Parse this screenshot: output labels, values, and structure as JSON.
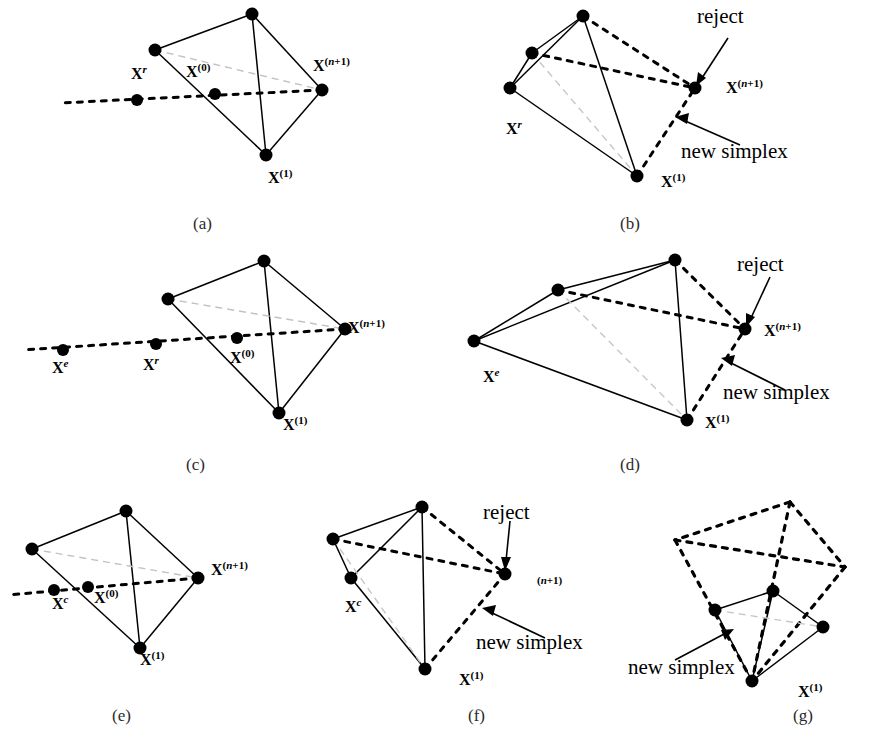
{
  "figure": {
    "background": "#ffffff",
    "ink": "#000000",
    "faint": "#b9b9b9",
    "width": 875,
    "height": 747
  },
  "captions": [
    {
      "id": "a",
      "text": "(a)",
      "x": 193,
      "y": 214
    },
    {
      "id": "b",
      "text": "(b)",
      "x": 620,
      "y": 214
    },
    {
      "id": "c",
      "text": "(c)",
      "x": 186,
      "y": 455
    },
    {
      "id": "d",
      "text": "(d)",
      "x": 620,
      "y": 455
    },
    {
      "id": "e",
      "text": "(e)",
      "x": 112,
      "y": 706
    },
    {
      "id": "f",
      "text": "(f)",
      "x": 468,
      "y": 706
    },
    {
      "id": "g",
      "text": "(g)",
      "x": 793,
      "y": 706
    }
  ],
  "panels": {
    "a": {
      "caption": "(a)",
      "operation": "reflection",
      "labels": [
        {
          "name": "x-r",
          "base": "X",
          "sup": "r",
          "sup_style": "italic",
          "x": 131,
          "y": 64
        },
        {
          "name": "x-0",
          "base": "X",
          "sup": "(0)",
          "sup_style": "roman",
          "x": 186,
          "y": 62
        },
        {
          "name": "x-n-plus-1",
          "base": "X",
          "sup": "(n+1)",
          "sup_style": "mixed",
          "x": 313,
          "y": 56
        },
        {
          "name": "x-1",
          "base": "X",
          "sup": "(1)",
          "sup_style": "roman",
          "x": 268,
          "y": 168
        }
      ],
      "annotations": []
    },
    "b": {
      "caption": "(b)",
      "operation": "reflection accepted - new simplex",
      "labels": [
        {
          "name": "x-r",
          "base": "X",
          "sup": "r",
          "sup_style": "italic",
          "x": 506,
          "y": 119
        },
        {
          "name": "x-n-plus-1",
          "base": "X",
          "sup": "(n+1)",
          "sup_style": "mixed",
          "x": 726,
          "y": 78
        },
        {
          "name": "x-1",
          "base": "X",
          "sup": "(1)",
          "sup_style": "roman",
          "x": 661,
          "y": 172
        }
      ],
      "annotations": [
        {
          "name": "reject-label",
          "text": "reject",
          "x": 697,
          "y": 4
        },
        {
          "name": "new-simplex-label",
          "text": "new simplex",
          "x": 681,
          "y": 139
        }
      ]
    },
    "c": {
      "caption": "(c)",
      "operation": "expansion",
      "labels": [
        {
          "name": "x-e",
          "base": "X",
          "sup": "e",
          "sup_style": "italic",
          "x": 52,
          "y": 358
        },
        {
          "name": "x-r",
          "base": "X",
          "sup": "r",
          "sup_style": "italic",
          "x": 143,
          "y": 355
        },
        {
          "name": "x-0",
          "base": "X",
          "sup": "(0)",
          "sup_style": "roman",
          "x": 230,
          "y": 348
        },
        {
          "name": "x-n-plus-1",
          "base": "X",
          "sup": "(n+1)",
          "sup_style": "mixed",
          "x": 348,
          "y": 318
        },
        {
          "name": "x-1",
          "base": "X",
          "sup": "(1)",
          "sup_style": "roman",
          "x": 283,
          "y": 415
        }
      ],
      "annotations": []
    },
    "d": {
      "caption": "(d)",
      "operation": "expansion accepted - new simplex",
      "labels": [
        {
          "name": "x-e",
          "base": "X",
          "sup": "e",
          "sup_style": "italic",
          "x": 483,
          "y": 367
        },
        {
          "name": "x-n-plus-1",
          "base": "X",
          "sup": "(n+1)",
          "sup_style": "mixed",
          "x": 764,
          "y": 321
        },
        {
          "name": "x-1",
          "base": "X",
          "sup": "(1)",
          "sup_style": "roman",
          "x": 705,
          "y": 413
        }
      ],
      "annotations": [
        {
          "name": "reject-label",
          "text": "reject",
          "x": 737,
          "y": 252
        },
        {
          "name": "new-simplex-label",
          "text": "new simplex",
          "x": 723,
          "y": 380
        }
      ]
    },
    "e": {
      "caption": "(e)",
      "operation": "contraction",
      "labels": [
        {
          "name": "x-c",
          "base": "X",
          "sup": "c",
          "sup_style": "italic",
          "x": 52,
          "y": 594
        },
        {
          "name": "x-0",
          "base": "X",
          "sup": "(0)",
          "sup_style": "roman",
          "x": 94,
          "y": 588
        },
        {
          "name": "x-n-plus-1",
          "base": "X",
          "sup": "(n+1)",
          "sup_style": "mixed",
          "x": 211,
          "y": 560
        },
        {
          "name": "x-1",
          "base": "X",
          "sup": "(1)",
          "sup_style": "roman",
          "x": 140,
          "y": 650
        }
      ],
      "annotations": []
    },
    "f": {
      "caption": "(f)",
      "operation": "contraction accepted - new simplex",
      "labels": [
        {
          "name": "x-c",
          "base": "X",
          "sup": "c",
          "sup_style": "italic",
          "x": 345,
          "y": 597
        },
        {
          "name": "n-plus-1",
          "base": "",
          "sup": "(n+1)",
          "sup_style": "mixed",
          "x": 537,
          "y": 575
        },
        {
          "name": "x-1",
          "base": "X",
          "sup": "(1)",
          "sup_style": "roman",
          "x": 459,
          "y": 670
        }
      ],
      "annotations": [
        {
          "name": "reject-label",
          "text": "reject",
          "x": 483,
          "y": 500
        },
        {
          "name": "new-simplex-label",
          "text": "new simplex",
          "x": 476,
          "y": 630
        }
      ]
    },
    "g": {
      "caption": "(g)",
      "operation": "shrink",
      "labels": [
        {
          "name": "x-1",
          "base": "X",
          "sup": "(1)",
          "sup_style": "roman",
          "x": 798,
          "y": 682
        }
      ],
      "annotations": [
        {
          "name": "new-simplex-label",
          "text": "new simplex",
          "x": 628,
          "y": 655
        }
      ]
    }
  }
}
